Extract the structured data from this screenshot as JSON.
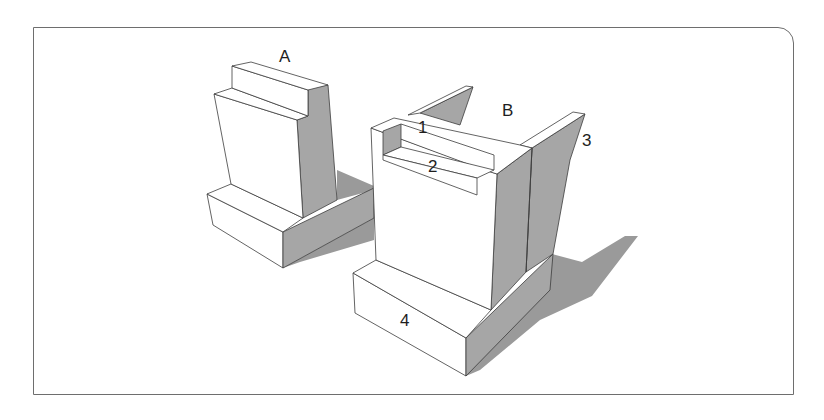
{
  "figure": {
    "labels": {
      "object_a": "A",
      "object_b": "B",
      "part_1": "1",
      "part_2": "2",
      "part_3": "3",
      "part_4": "4"
    },
    "colors": {
      "background": "#ffffff",
      "frame": "#6e6e6e",
      "face_light": "#ffffff",
      "face_shaded": "#a6a6a6",
      "shadow": "#9a9a9a",
      "edge": "#3c3c3c"
    }
  }
}
